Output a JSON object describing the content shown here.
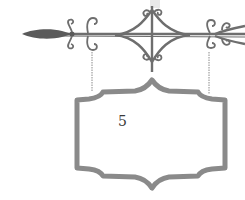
{
  "image": {
    "subject": "wrought-iron hanging sign",
    "sign": {
      "number": "5"
    },
    "colors": {
      "iron": "#6e6e6e",
      "sign_frame": "#8a8a8a",
      "background": "#ffffff",
      "text": "#3a3a3a"
    }
  }
}
